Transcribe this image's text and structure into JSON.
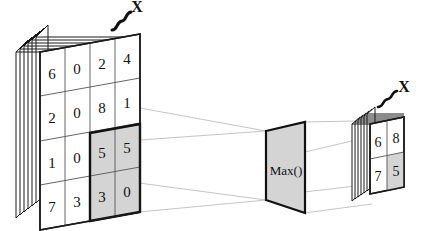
{
  "diagram": {
    "background_color": "#ffffff",
    "ink_color": "#111111",
    "shade_color": "#d4d4d4",
    "line_color": "#b5b5b5"
  },
  "input": {
    "name": "input-feature-map",
    "rows": 4,
    "cols": 4,
    "depth_label": "X",
    "depth_layers": 6,
    "values": [
      [
        "6",
        "0",
        "2",
        "4"
      ],
      [
        "2",
        "0",
        "8",
        "1"
      ],
      [
        "1",
        "0",
        "5",
        "5"
      ],
      [
        "7",
        "3",
        "3",
        "0"
      ]
    ],
    "highlight": {
      "name": "pooling-window",
      "row_start": 2,
      "col_start": 2,
      "row_end": 3,
      "col_end": 3,
      "values": [
        [
          "5",
          "5"
        ],
        [
          "3",
          "0"
        ]
      ]
    }
  },
  "operation": {
    "name": "max-operation-plane",
    "label": "Max()"
  },
  "output": {
    "name": "output-feature-map",
    "rows": 2,
    "cols": 2,
    "depth_label": "X",
    "depth_layers": 6,
    "values": [
      [
        "6",
        "8"
      ],
      [
        "7",
        "5"
      ]
    ],
    "highlight": {
      "name": "pooled-result-cell",
      "row": 1,
      "col": 1,
      "value": "5"
    }
  }
}
